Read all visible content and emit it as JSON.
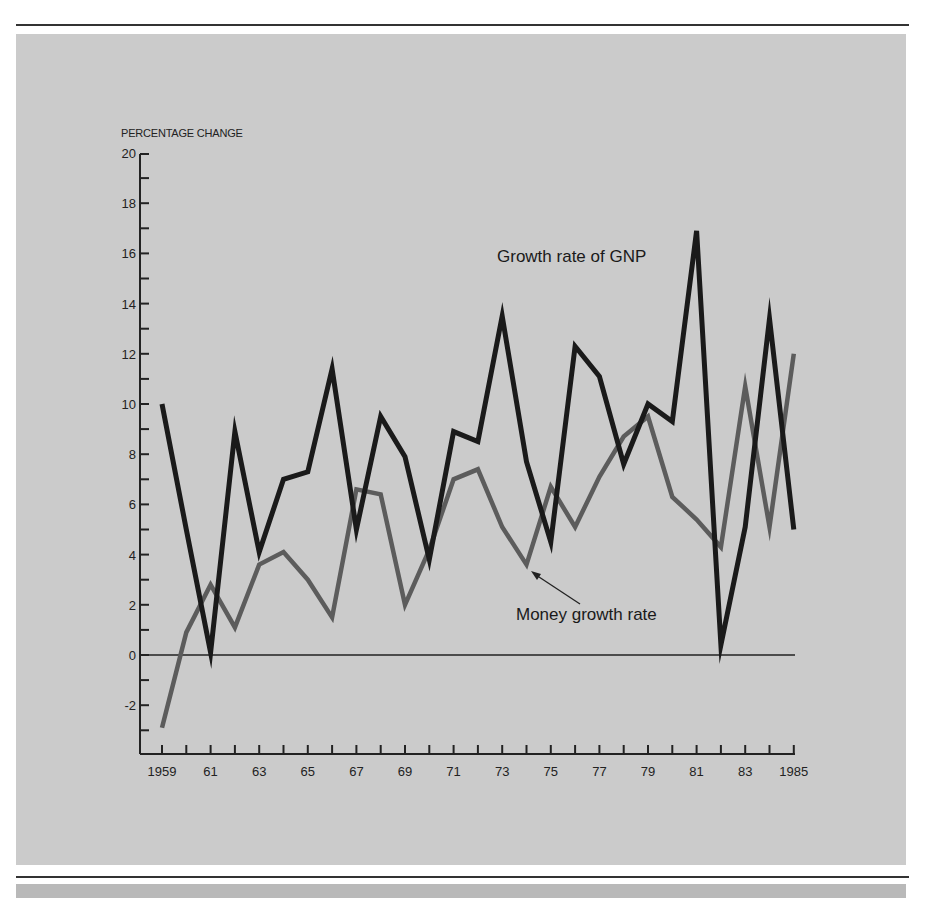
{
  "chart_data": {
    "type": "line",
    "title": "",
    "ylabel": "PERCENTAGE CHANGE",
    "xlabel": "",
    "ylim": [
      -4,
      20
    ],
    "xlim": [
      1959,
      1985
    ],
    "grid": false,
    "yticks": [
      -2,
      0,
      2,
      4,
      6,
      8,
      10,
      12,
      14,
      16,
      18,
      20
    ],
    "xtick_labels": [
      "1959",
      "61",
      "63",
      "65",
      "67",
      "69",
      "71",
      "73",
      "75",
      "77",
      "79",
      "81",
      "83",
      "1985"
    ],
    "x": [
      1959,
      1960,
      1961,
      1962,
      1963,
      1964,
      1965,
      1966,
      1967,
      1968,
      1969,
      1970,
      1971,
      1972,
      1973,
      1974,
      1975,
      1976,
      1977,
      1978,
      1979,
      1980,
      1981,
      1982,
      1983,
      1984,
      1985
    ],
    "series": [
      {
        "name": "Growth rate of GNP",
        "color": "#1a1a1a",
        "values": [
          10.0,
          5.0,
          0.1,
          8.9,
          4.1,
          7.0,
          7.3,
          11.4,
          5.0,
          9.5,
          7.9,
          3.8,
          8.9,
          8.5,
          13.5,
          7.7,
          4.5,
          12.3,
          11.1,
          7.6,
          10.0,
          9.3,
          16.9,
          0.4,
          5.1,
          13.4,
          5.0
        ]
      },
      {
        "name": "Money growth rate",
        "color": "#5c5c5c",
        "values": [
          -2.9,
          0.9,
          2.8,
          1.1,
          3.6,
          4.1,
          3.0,
          1.5,
          6.6,
          6.4,
          2.0,
          4.2,
          7.0,
          7.4,
          5.1,
          3.6,
          6.7,
          5.1,
          7.1,
          8.7,
          9.5,
          6.3,
          5.4,
          4.3,
          10.7,
          5.1,
          12.0
        ]
      }
    ],
    "annotations": [
      {
        "text": "Growth rate of GNP",
        "x": 1973,
        "y": 15.5
      },
      {
        "text": "Money growth rate",
        "x": 1976.5,
        "y": 1.5,
        "arrow_to": {
          "x": 1974.2,
          "y": 3.2
        }
      }
    ]
  }
}
